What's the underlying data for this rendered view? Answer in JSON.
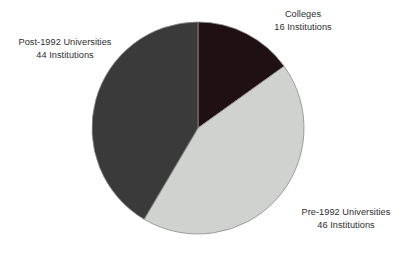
{
  "chart_data": {
    "type": "pie",
    "title": "",
    "subtitle": "",
    "xlabel": "",
    "ylabel": "",
    "grid": false,
    "legend_position": "none",
    "label_style": "external",
    "unit_label": "Institutions",
    "total": 106,
    "start_angle_deg": 0,
    "direction": "clockwise",
    "categories": [
      "Colleges",
      "Pre-1992 Universities",
      "Post-1992 Universities"
    ],
    "values": [
      16,
      46,
      44
    ],
    "colors": [
      "#1f1013",
      "#d0d2d0",
      "#3a3a3a"
    ],
    "slices": [
      {
        "name": "Colleges",
        "value": 16,
        "value_label": "16 Institutions",
        "percent": 15.1,
        "angle_deg": 54.3,
        "color": "#1f1013",
        "label_position": "top-right"
      },
      {
        "name": "Pre-1992 Universities",
        "value": 46,
        "value_label": "46 Institutions",
        "percent": 43.4,
        "angle_deg": 156.2,
        "color": "#d0d2d0",
        "label_position": "bottom-right"
      },
      {
        "name": "Post-1992 Universities",
        "value": 44,
        "value_label": "44 Institutions",
        "percent": 41.5,
        "angle_deg": 149.4,
        "color": "#3a3a3a",
        "label_position": "left"
      }
    ],
    "geometry": {
      "center_x": 198,
      "center_y": 128,
      "radius": 106
    },
    "stroke_color": "#8a8a8a",
    "background": "#ffffff"
  },
  "labels": {
    "colleges": {
      "name": "Colleges",
      "value": "16 Institutions"
    },
    "pre1992": {
      "name": "Pre-1992 Universities",
      "value": "46 Institutions"
    },
    "post1992": {
      "name": "Post-1992 Universities",
      "value": "44 Institutions"
    }
  }
}
